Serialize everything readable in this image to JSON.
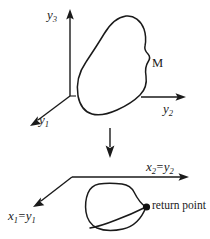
{
  "figure": {
    "background_color": "#ffffff",
    "stroke_color": "#1a1a1a",
    "upper_panel": {
      "description": "three-dimensional coordinate frame with closed manifold curve",
      "axes": [
        {
          "name": "y3-axis",
          "label": "y",
          "subscript": "3",
          "direction": "up"
        },
        {
          "name": "y2-axis",
          "label": "y",
          "subscript": "2",
          "direction": "right"
        },
        {
          "name": "y1-axis",
          "label": "y",
          "subscript": "1",
          "direction": "down-left"
        }
      ],
      "manifold_label": "M"
    },
    "projection_arrow": {
      "name": "projection-arrow",
      "direction": "down"
    },
    "lower_panel": {
      "description": "two-dimensional coordinate frame with projected closed loop",
      "axes": [
        {
          "name": "x2-equals-y2-axis",
          "first_symbol": "x",
          "first_subscript": "2",
          "equals": "=",
          "second_symbol": "y",
          "second_subscript": "2",
          "direction": "right"
        },
        {
          "name": "x1-equals-y1-axis",
          "first_symbol": "x",
          "first_subscript": "1",
          "equals": "=",
          "second_symbol": "y",
          "second_subscript": "1",
          "direction": "down-left"
        }
      ],
      "return_point_label": "return point"
    }
  }
}
